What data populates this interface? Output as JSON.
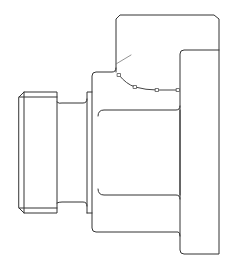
{
  "drawing": {
    "description": "Technical line drawing of a cylindrical fitting / flanged nut in side view",
    "stroke_color": "#333333",
    "point_color": "#555555",
    "background": "#ffffff",
    "annotation_points": [
      {
        "x": 119,
        "y": 75
      },
      {
        "x": 135,
        "y": 87
      },
      {
        "x": 157,
        "y": 90
      },
      {
        "x": 178,
        "y": 90
      }
    ]
  }
}
